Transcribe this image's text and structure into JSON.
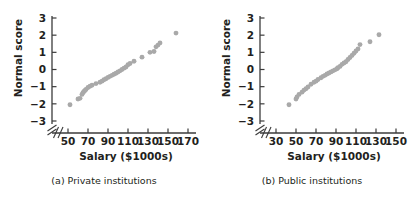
{
  "figure": {
    "colors": {
      "marker": "#a9a9a9",
      "axis": "#3b3b3b",
      "text": "#231f20",
      "background": "#ffffff"
    }
  },
  "chart_data": [
    {
      "type": "scatter",
      "title": "",
      "caption": "(a) Private institutions",
      "xlabel": "Salary ($1000s)",
      "ylabel": "Normal score",
      "xticks": [
        50,
        70,
        90,
        110,
        130,
        150,
        170
      ],
      "yticks": [
        3,
        2,
        1,
        0,
        -1,
        -2,
        -3
      ],
      "xlim": [
        40,
        180
      ],
      "ylim": [
        -3,
        3
      ],
      "grid": false,
      "legend": false,
      "axis_break_x": true,
      "axis_break_y": true,
      "x": [
        52,
        60,
        62,
        64,
        65,
        66,
        67,
        68,
        70,
        72,
        74,
        78,
        82,
        84,
        86,
        88,
        90,
        92,
        94,
        96,
        98,
        100,
        102,
        104,
        106,
        108,
        110,
        112,
        116,
        124,
        132,
        136,
        138,
        140,
        142,
        158
      ],
      "y": [
        -2.05,
        -1.72,
        -1.68,
        -1.45,
        -1.35,
        -1.28,
        -1.22,
        -1.16,
        -1.05,
        -0.98,
        -0.92,
        -0.82,
        -0.74,
        -0.68,
        -0.6,
        -0.54,
        -0.46,
        -0.4,
        -0.34,
        -0.28,
        -0.22,
        -0.15,
        -0.08,
        0.0,
        0.08,
        0.15,
        0.28,
        0.35,
        0.48,
        0.72,
        1.0,
        1.05,
        1.32,
        1.42,
        1.55,
        2.12
      ]
    },
    {
      "type": "scatter",
      "title": "",
      "caption": "(b) Public institutions",
      "xlabel": "Salary ($1000s)",
      "ylabel": "Normal score",
      "xticks": [
        30,
        50,
        70,
        90,
        110,
        130,
        150
      ],
      "yticks": [
        3,
        2,
        1,
        0,
        -1,
        -2,
        -3
      ],
      "xlim": [
        22,
        158
      ],
      "ylim": [
        -3,
        3
      ],
      "grid": false,
      "legend": false,
      "axis_break_x": true,
      "axis_break_y": true,
      "x": [
        43,
        50,
        51,
        53,
        56,
        58,
        60,
        62,
        65,
        68,
        70,
        72,
        75,
        77,
        79,
        81,
        83,
        85,
        87,
        89,
        91,
        92,
        94,
        96,
        98,
        100,
        102,
        104,
        106,
        108,
        110,
        112,
        114,
        124,
        133
      ],
      "y": [
        -2.05,
        -1.72,
        -1.6,
        -1.45,
        -1.32,
        -1.2,
        -1.12,
        -1.02,
        -0.86,
        -0.74,
        -0.68,
        -0.58,
        -0.48,
        -0.4,
        -0.34,
        -0.26,
        -0.2,
        -0.14,
        -0.08,
        -0.02,
        0.04,
        0.1,
        0.18,
        0.3,
        0.38,
        0.45,
        0.58,
        0.7,
        0.82,
        0.95,
        1.08,
        1.2,
        1.45,
        1.62,
        2.02
      ]
    }
  ]
}
